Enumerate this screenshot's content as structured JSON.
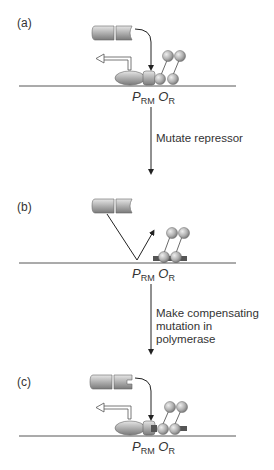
{
  "panels": [
    {
      "label": "(a)",
      "promoter": "P",
      "promoter_sub": "RM",
      "operator": "O",
      "operator_sub": "R"
    },
    {
      "label": "(b)",
      "promoter": "P",
      "promoter_sub": "RM",
      "operator": "O",
      "operator_sub": "R"
    },
    {
      "label": "(c)",
      "promoter": "P",
      "promoter_sub": "RM",
      "operator": "O",
      "operator_sub": "R"
    }
  ],
  "steps": [
    {
      "text": "Mutate repressor"
    },
    {
      "text_line1": "Make compensating",
      "text_line2": "mutation in polymerase"
    }
  ],
  "colors": {
    "protein_fill": "#b8b8b8",
    "protein_dark": "#6e6e6e",
    "mutation_mark": "#555555",
    "line": "#222222"
  }
}
